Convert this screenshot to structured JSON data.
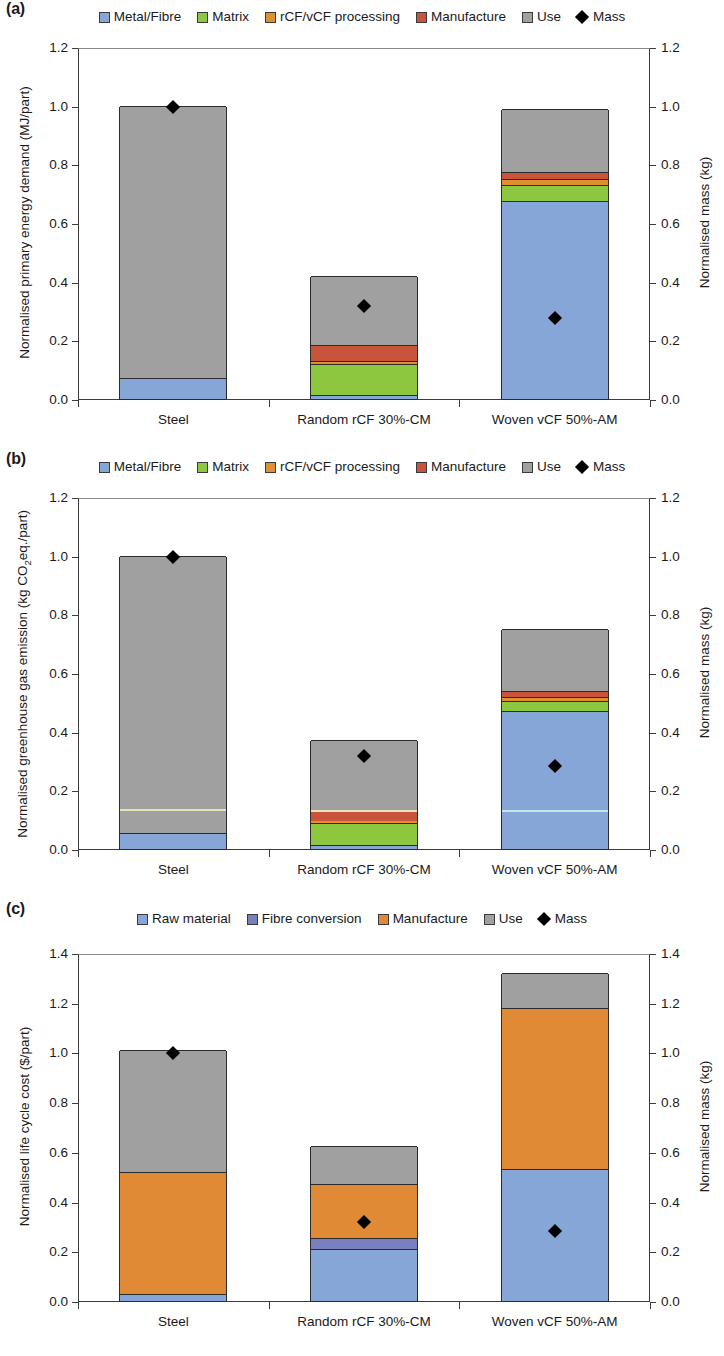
{
  "figure": {
    "panels": [
      "(a)",
      "(b)",
      "(c)"
    ],
    "categories": [
      "Steel",
      "Random rCF 30%-CM",
      "Woven vCF 50%-AM"
    ],
    "right_axis_label": "Normalised mass (kg)",
    "mass_marker_label": "Mass"
  },
  "colors": {
    "metal_fibre": "#86a6d8",
    "matrix": "#8dc63f",
    "processing": "#e09030",
    "manufacture": "#c8553b",
    "use": "#a0a0a0",
    "raw_material": "#86a6d8",
    "fibre_conversion": "#7a7fc0",
    "manufacture_c": "#e08a35",
    "use_c": "#a0a0a0",
    "mass_marker": "#000000",
    "axis": "#3c3c3c"
  },
  "panel_a": {
    "tag": "(a)",
    "legend": [
      {
        "label": "Metal/Fibre",
        "color": "#86a6d8",
        "type": "swatch"
      },
      {
        "label": "Matrix",
        "color": "#8dc63f",
        "type": "swatch"
      },
      {
        "label": "rCF/vCF processing",
        "color": "#e09030",
        "type": "swatch"
      },
      {
        "label": "Manufacture",
        "color": "#c8553b",
        "type": "swatch"
      },
      {
        "label": "Use",
        "color": "#a0a0a0",
        "type": "swatch"
      },
      {
        "label": "Mass",
        "color": "#000000",
        "type": "diamond"
      }
    ],
    "chart_data": {
      "type": "bar",
      "stacked": true,
      "title": "",
      "xlabel": "",
      "ylabel": "Normalised primary energy demand (MJ/part)",
      "y2label": "Normalised mass (kg)",
      "ylim": [
        0.0,
        1.2
      ],
      "y2lim": [
        0.0,
        1.2
      ],
      "yticks": [
        "0.0",
        "0.2",
        "0.4",
        "0.6",
        "0.8",
        "1.0",
        "1.2"
      ],
      "y2ticks": [
        "0.0",
        "0.2",
        "0.4",
        "0.6",
        "0.8",
        "1.0",
        "1.2"
      ],
      "grid": false,
      "legend_position": "top-center",
      "categories": [
        "Steel",
        "Random rCF 30%-CM",
        "Woven vCF 50%-AM"
      ],
      "series": [
        {
          "name": "Metal/Fibre",
          "color": "#86a6d8",
          "values": [
            0.07,
            0.015,
            0.675
          ]
        },
        {
          "name": "Matrix",
          "color": "#8dc63f",
          "values": [
            0.0,
            0.105,
            0.055
          ]
        },
        {
          "name": "rCF/vCF processing",
          "color": "#e09030",
          "values": [
            0.0,
            0.01,
            0.02
          ]
        },
        {
          "name": "Manufacture",
          "color": "#c8553b",
          "values": [
            0.0,
            0.055,
            0.025
          ]
        },
        {
          "name": "Use",
          "color": "#a0a0a0",
          "values": [
            0.93,
            0.235,
            0.215
          ]
        }
      ],
      "totals": [
        1.0,
        0.42,
        0.99
      ],
      "mass_marker": {
        "name": "Mass",
        "values": [
          1.0,
          0.32,
          0.28
        ]
      }
    }
  },
  "panel_b": {
    "tag": "(b)",
    "legend": [
      {
        "label": "Metal/Fibre",
        "color": "#86a6d8",
        "type": "swatch"
      },
      {
        "label": "Matrix",
        "color": "#8dc63f",
        "type": "swatch"
      },
      {
        "label": "rCF/vCF processing",
        "color": "#e09030",
        "type": "swatch"
      },
      {
        "label": "Manufacture",
        "color": "#c8553b",
        "type": "swatch"
      },
      {
        "label": "Use",
        "color": "#a0a0a0",
        "type": "swatch"
      },
      {
        "label": "Mass",
        "color": "#000000",
        "type": "diamond"
      }
    ],
    "chart_data": {
      "type": "bar",
      "stacked": true,
      "title": "",
      "xlabel": "",
      "ylabel": "Normalised greenhouse gas emission (kg CO2eq./part)",
      "y2label": "Normalised mass (kg)",
      "ylim": [
        0.0,
        1.2
      ],
      "y2lim": [
        0.0,
        1.2
      ],
      "yticks": [
        "0.0",
        "0.2",
        "0.4",
        "0.6",
        "0.8",
        "1.0",
        "1.2"
      ],
      "y2ticks": [
        "0.0",
        "0.2",
        "0.4",
        "0.6",
        "0.8",
        "1.0",
        "1.2"
      ],
      "grid": false,
      "legend_position": "top-center",
      "categories": [
        "Steel",
        "Random rCF 30%-CM",
        "Woven vCF 50%-AM"
      ],
      "series": [
        {
          "name": "Metal/Fibre",
          "color": "#86a6d8",
          "values": [
            0.055,
            0.012,
            0.47
          ]
        },
        {
          "name": "Matrix",
          "color": "#8dc63f",
          "values": [
            0.0,
            0.075,
            0.035
          ]
        },
        {
          "name": "rCF/vCF processing",
          "color": "#e09030",
          "values": [
            0.0,
            0.008,
            0.012
          ]
        },
        {
          "name": "Manufacture",
          "color": "#c8553b",
          "values": [
            0.0,
            0.035,
            0.022
          ]
        },
        {
          "name": "Use",
          "color": "#a0a0a0",
          "values": [
            0.945,
            0.24,
            0.21
          ]
        }
      ],
      "totals": [
        1.0,
        0.37,
        0.75
      ],
      "mass_marker": {
        "name": "Mass",
        "values": [
          1.0,
          0.32,
          0.285
        ]
      }
    }
  },
  "panel_c": {
    "tag": "(c)",
    "legend": [
      {
        "label": "Raw material",
        "color": "#86a6d8",
        "type": "swatch"
      },
      {
        "label": "Fibre conversion",
        "color": "#7a7fc0",
        "type": "swatch"
      },
      {
        "label": "Manufacture",
        "color": "#e08a35",
        "type": "swatch"
      },
      {
        "label": "Use",
        "color": "#a0a0a0",
        "type": "swatch"
      },
      {
        "label": "Mass",
        "color": "#000000",
        "type": "diamond"
      }
    ],
    "chart_data": {
      "type": "bar",
      "stacked": true,
      "title": "",
      "xlabel": "",
      "ylabel": "Normalised life cycle cost ($/part)",
      "y2label": "Normalised mass (kg)",
      "ylim": [
        0.0,
        1.4
      ],
      "y2lim": [
        0.0,
        1.4
      ],
      "yticks": [
        "0.0",
        "0.2",
        "0.4",
        "0.6",
        "0.8",
        "1.0",
        "1.2",
        "1.4"
      ],
      "y2ticks": [
        "0.0",
        "0.2",
        "0.4",
        "0.6",
        "0.8",
        "1.0",
        "1.2",
        "1.4"
      ],
      "grid": false,
      "legend_position": "top-center",
      "categories": [
        "Steel",
        "Random rCF 30%-CM",
        "Woven vCF 50%-AM"
      ],
      "series": [
        {
          "name": "Raw material",
          "color": "#86a6d8",
          "values": [
            0.03,
            0.21,
            0.53
          ]
        },
        {
          "name": "Fibre conversion",
          "color": "#7a7fc0",
          "values": [
            0.0,
            0.045,
            0.0
          ]
        },
        {
          "name": "Manufacture",
          "color": "#e08a35",
          "values": [
            0.49,
            0.215,
            0.65
          ]
        },
        {
          "name": "Use",
          "color": "#a0a0a0",
          "values": [
            0.49,
            0.155,
            0.14
          ]
        }
      ],
      "totals": [
        1.01,
        0.625,
        1.32
      ],
      "mass_marker": {
        "name": "Mass",
        "values": [
          1.0,
          0.32,
          0.285
        ]
      }
    }
  }
}
